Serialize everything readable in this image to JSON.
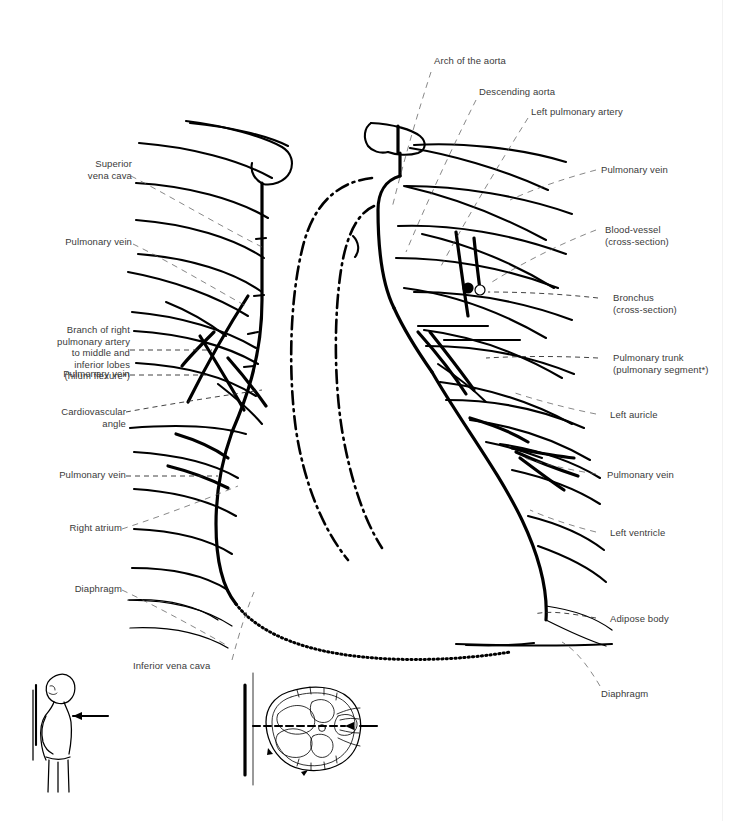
{
  "figure": {
    "background_color": "#ffffff",
    "line_color": "#000000",
    "label_color": "#3a3a3a"
  },
  "labels": {
    "left": [
      {
        "id": "superior-vena-cava",
        "text": "Superior\nvena cava"
      },
      {
        "id": "pulmonary-vein-upper-left",
        "text": "Pulmonary vein"
      },
      {
        "id": "branch-right-pulmonary-artery",
        "text": "Branch of right\npulmonary artery\nto middle and\ninferior lobes\n(hilum flexure*)"
      },
      {
        "id": "pulmonary-vein-mid-left",
        "text": "Pulmonary vein"
      },
      {
        "id": "cardiovascular-angle",
        "text": "Cardiovascular\nangle"
      },
      {
        "id": "pulmonary-vein-lower-left",
        "text": "Pulmonary vein"
      },
      {
        "id": "right-atrium",
        "text": "Right atrium"
      },
      {
        "id": "diaphragm-left",
        "text": "Diaphragm"
      },
      {
        "id": "inferior-vena-cava",
        "text": "Inferior vena cava"
      }
    ],
    "top": [
      {
        "id": "arch-of-the-aorta",
        "text": "Arch of the aorta"
      },
      {
        "id": "descending-aorta",
        "text": "Descending aorta"
      },
      {
        "id": "left-pulmonary-artery",
        "text": "Left pulmonary artery"
      }
    ],
    "right": [
      {
        "id": "pulmonary-vein-upper-right",
        "text": "Pulmonary vein"
      },
      {
        "id": "blood-vessel-cross-section",
        "text": "Blood-vessel\n(cross-section)"
      },
      {
        "id": "bronchus-cross-section",
        "text": "Bronchus\n(cross-section)"
      },
      {
        "id": "pulmonary-trunk",
        "text": "Pulmonary trunk\n(pulmonary segment*)"
      },
      {
        "id": "left-auricle",
        "text": "Left auricle"
      },
      {
        "id": "pulmonary-vein-right",
        "text": "Pulmonary vein"
      },
      {
        "id": "left-ventricle",
        "text": "Left ventricle"
      },
      {
        "id": "adipose-body",
        "text": "Adipose body"
      },
      {
        "id": "diaphragm-right",
        "text": "Diaphragm"
      }
    ]
  },
  "insets": {
    "body-position": {
      "id": "body-position-inset",
      "description": "standing patient, posteroanterior beam direction"
    },
    "thorax-cross-section": {
      "id": "thorax-cross-section-inset",
      "description": "axial thorax with beam axis"
    }
  }
}
